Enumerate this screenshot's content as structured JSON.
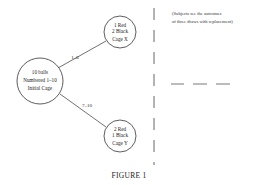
{
  "diagram": {
    "initial_cage": {
      "lines": [
        "10 balls",
        "Numbered 1–10",
        "Initial Cage"
      ]
    },
    "cage_x": {
      "lines": [
        "1 Red",
        "2 Black",
        "Cage X"
      ]
    },
    "cage_y": {
      "lines": [
        "2 Red",
        "1 Black",
        "Cage Y"
      ]
    },
    "edges": [
      {
        "from": "initial_cage",
        "to": "cage_x",
        "label": "1–6"
      },
      {
        "from": "initial_cage",
        "to": "cage_y",
        "label": "7–10"
      }
    ],
    "note": {
      "lines": [
        "(Subjects see the outcomes",
        "of three draws with replacement)"
      ]
    },
    "answer_blanks": 3,
    "caption": "FIGURE 1"
  }
}
